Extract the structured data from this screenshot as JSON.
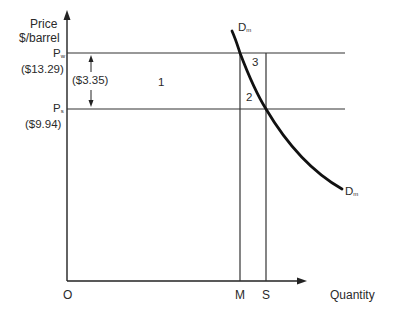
{
  "diagram": {
    "type": "supply-demand",
    "y_axis": {
      "label_line1": "Price",
      "label_line2": "$/barrel"
    },
    "x_axis": {
      "label": "Quantity",
      "origin_label": "O"
    },
    "price_levels": [
      {
        "symbol": "P",
        "subscript": "w",
        "value_label": "($13.29)"
      },
      {
        "symbol": "P",
        "subscript": "s",
        "value_label": "($9.94)"
      }
    ],
    "price_difference_label": "($3.35)",
    "quantity_marks": [
      {
        "label": "M"
      },
      {
        "label": "S"
      }
    ],
    "curve": {
      "symbol": "D",
      "subscript": "m",
      "top_label": "D",
      "bottom_label": "D"
    },
    "regions": [
      {
        "label": "1"
      },
      {
        "label": "2"
      },
      {
        "label": "3"
      }
    ],
    "line_color": "#1a1a1a",
    "curve_color": "#111111"
  }
}
